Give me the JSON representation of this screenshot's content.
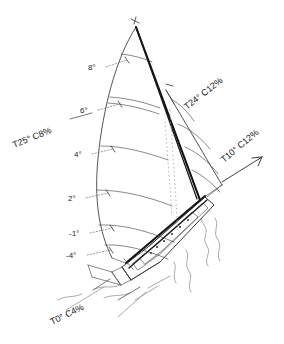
{
  "figure": {
    "kind": "sailboat-sail-trim-diagram",
    "background_color": "#ffffff",
    "ink_color": "#242424"
  },
  "mast_tick_labels": [
    {
      "id": "t8",
      "text": "8°"
    },
    {
      "id": "t6",
      "text": "6°"
    },
    {
      "id": "t4",
      "text": "4°"
    },
    {
      "id": "t2",
      "text": "2°"
    },
    {
      "id": "tm1",
      "text": "-1°"
    },
    {
      "id": "tm4",
      "text": "-4°"
    }
  ],
  "trim_callouts": [
    {
      "id": "upper-left",
      "text": "T25° C8%"
    },
    {
      "id": "upper-right",
      "text": "T24° C12%"
    },
    {
      "id": "wind-arrow",
      "text": "T10° C12%"
    },
    {
      "id": "lower-left",
      "text": "T0° C4%"
    }
  ]
}
